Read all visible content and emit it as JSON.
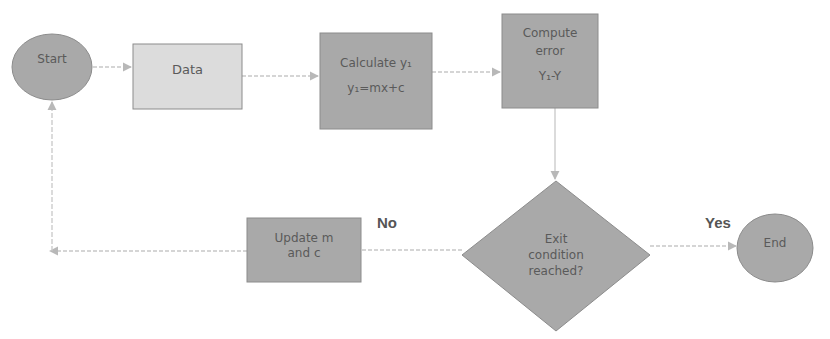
{
  "diagram": {
    "type": "flowchart",
    "nodes": {
      "start": {
        "label": "Start",
        "shape": "ellipse"
      },
      "data": {
        "label": "Data",
        "shape": "rectangle"
      },
      "calculate": {
        "line1": "Calculate y₁",
        "line2": "y₁=mx+c",
        "shape": "rectangle"
      },
      "compute": {
        "line1": "Compute",
        "line2": "error",
        "line3": "Y₁-Y",
        "shape": "rectangle"
      },
      "exit": {
        "line1": "Exit",
        "line2": "condition",
        "line3": "reached?",
        "shape": "diamond"
      },
      "update": {
        "line1": "Update m",
        "line2": "and c",
        "shape": "rectangle"
      },
      "end": {
        "label": "End",
        "shape": "ellipse"
      }
    },
    "edge_labels": {
      "no": "No",
      "yes": "Yes"
    },
    "edges": [
      {
        "from": "start",
        "to": "data"
      },
      {
        "from": "data",
        "to": "calculate"
      },
      {
        "from": "calculate",
        "to": "compute"
      },
      {
        "from": "compute",
        "to": "exit"
      },
      {
        "from": "exit",
        "to": "end",
        "label": "Yes"
      },
      {
        "from": "exit",
        "to": "update",
        "label": "No"
      },
      {
        "from": "update",
        "to": "start"
      }
    ]
  },
  "colors": {
    "light_fill": "#dcdcdc",
    "dark_fill": "#a9a9a9",
    "stroke": "#8c8c8c",
    "connector": "#c8c8c8",
    "text": "#5a5a5a"
  }
}
